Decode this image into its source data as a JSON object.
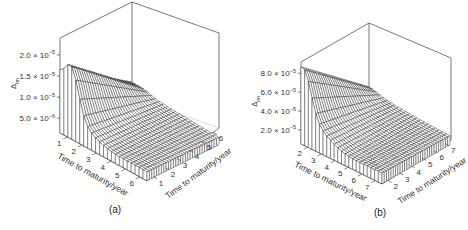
{
  "chart_data": [
    {
      "type": "surface",
      "panel_label": "(a)",
      "title": "",
      "zlabel": "Δ_nn",
      "zlabel_main": "Δ",
      "zlabel_sub": "nn",
      "x_axis": {
        "label": "Time to maturity/year",
        "ticks": [
          "1",
          "2",
          "3",
          "4",
          "5",
          "6"
        ],
        "range": [
          0.5,
          6.5
        ]
      },
      "y_axis": {
        "label": "Time to maturity/year",
        "ticks": [
          "1",
          "2",
          "3",
          "4",
          "5",
          "6"
        ],
        "range": [
          0.5,
          6.5
        ]
      },
      "z_axis": {
        "ticks": [
          {
            "mant": "5.0",
            "exp": "−6",
            "value": 5e-06
          },
          {
            "mant": "1.0",
            "exp": "−5",
            "value": 1e-05
          },
          {
            "mant": "1.5",
            "exp": "−5",
            "value": 1.5e-05
          },
          {
            "mant": "2.0",
            "exp": "−5",
            "value": 2e-05
          }
        ],
        "range": [
          1.5e-06,
          2.4e-05
        ]
      },
      "surface": {
        "peak_value": 2e-05,
        "peak_x": 1.3,
        "edge_value_x_min": 1.45e-05,
        "plateau_value": 6.5e-06,
        "floor_value": 3e-06,
        "grid_x": 22,
        "grid_y": 30
      },
      "grid": false
    },
    {
      "type": "surface",
      "panel_label": "(b)",
      "title": "",
      "zlabel": "Δ_nn",
      "zlabel_main": "Δ",
      "zlabel_sub": "nn",
      "x_axis": {
        "label": "Time to maturity/year",
        "ticks": [
          "2",
          "3",
          "4",
          "5",
          "6",
          "7"
        ],
        "range": [
          1.5,
          7.5
        ]
      },
      "y_axis": {
        "label": "Time to maturity/year",
        "ticks": [
          "2",
          "3",
          "4",
          "5",
          "6",
          "7"
        ],
        "range": [
          1.5,
          7.5
        ]
      },
      "z_axis": {
        "ticks": [
          {
            "mant": "2.0",
            "exp": "−5",
            "value": 2e-05
          },
          {
            "mant": "4.0",
            "exp": "−5",
            "value": 4e-05
          },
          {
            "mant": "6.0",
            "exp": "−5",
            "value": 6e-05
          },
          {
            "mant": "8.0",
            "exp": "−5",
            "value": 8e-05
          }
        ],
        "range": [
          5e-06,
          9.2e-05
        ]
      },
      "surface": {
        "peak_value": 7.4e-05,
        "peak_x": 1.8,
        "edge_value_x_min": 7.2e-05,
        "plateau_value": 3.2e-05,
        "floor_value": 1.3e-05,
        "grid_x": 22,
        "grid_y": 30
      },
      "grid": false
    }
  ],
  "layout": {
    "panels": [
      {
        "floor_left": [
          60,
          133
        ],
        "floor_front": [
          147,
          181
        ],
        "floor_right": [
          219,
          128
        ],
        "floor_back": [
          132,
          97
        ],
        "height": 95,
        "label_pos": [
          115,
          213
        ]
      },
      {
        "floor_left": [
          301,
          144
        ],
        "floor_front": [
          382,
          184
        ],
        "floor_right": [
          451,
          140
        ],
        "floor_back": [
          369,
          105
        ],
        "height": 82,
        "label_pos": [
          380,
          216
        ]
      }
    ],
    "colors": {
      "mesh_line": "#2a2a2a",
      "mesh_fill": "#ffffff",
      "box": "#555555",
      "text": "#333333"
    }
  }
}
